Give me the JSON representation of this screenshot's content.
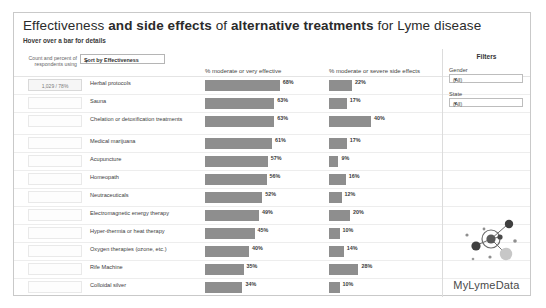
{
  "header": {
    "title_part1": "Effectiveness ",
    "title_part2": "and side effects ",
    "title_part3": "of ",
    "title_part4": "alternative treatments ",
    "title_part5": "for Lyme disease",
    "subtitle": "Hover over a bar for details"
  },
  "controls": {
    "count_label": "Count and percent of respondents using",
    "sort_label": "Sort by Effectiveness",
    "sort_caret": "▼"
  },
  "filters": {
    "title": "Filters",
    "gender_label": "Gender",
    "gender_value": "(All)",
    "state_label": "State",
    "state_value": "(All)",
    "caret": "▼"
  },
  "logo": {
    "text": "MyLymeData"
  },
  "tooltip": {
    "first_row_value": "1,029 / 78%"
  },
  "colors": {
    "bar": "#8e8e8e",
    "panel_border": "#c9c9c9",
    "row_divider": "#ededed",
    "logo_dark": "#4a4a4a",
    "logo_mid": "#8f8f8f",
    "logo_light": "#c7c7c7"
  },
  "chart_data": {
    "type": "bar",
    "title": "Effectiveness and side effects of alternative treatments for Lyme disease",
    "subtitle": "Hover over a bar for details",
    "orientation": "horizontal",
    "grid": false,
    "legend": "none",
    "xlabel": "",
    "ylabel": "",
    "xlim": [
      0,
      100
    ],
    "categories": [
      "Herbal protocols",
      "Sauna",
      "Chelation or detoxification treatments",
      "Medical marijuana",
      "Acupuncture",
      "Homeopath",
      "Neutraceuticals",
      "Electromagnetic energy therapy",
      "Hyper-thermia or heat therapy",
      "Oxygen therapies (ozone, etc.)",
      "Rife Machine",
      "Colloidal silver"
    ],
    "series": [
      {
        "name": "% moderate or very effective",
        "values": [
          68,
          63,
          63,
          61,
          57,
          56,
          52,
          49,
          45,
          40,
          35,
          34
        ],
        "labels": [
          "68%",
          "63%",
          "63%",
          "61%",
          "57%",
          "56%",
          "52%",
          "49%",
          "45%",
          "40%",
          "35%",
          "34%"
        ]
      },
      {
        "name": "% moderate or severe side effects",
        "values": [
          22,
          17,
          40,
          17,
          9,
          16,
          12,
          20,
          10,
          14,
          28,
          10
        ],
        "labels": [
          "22%",
          "17%",
          "40%",
          "17%",
          "9%",
          "16%",
          "12%",
          "20%",
          "10%",
          "14%",
          "28%",
          "10%"
        ]
      }
    ]
  }
}
